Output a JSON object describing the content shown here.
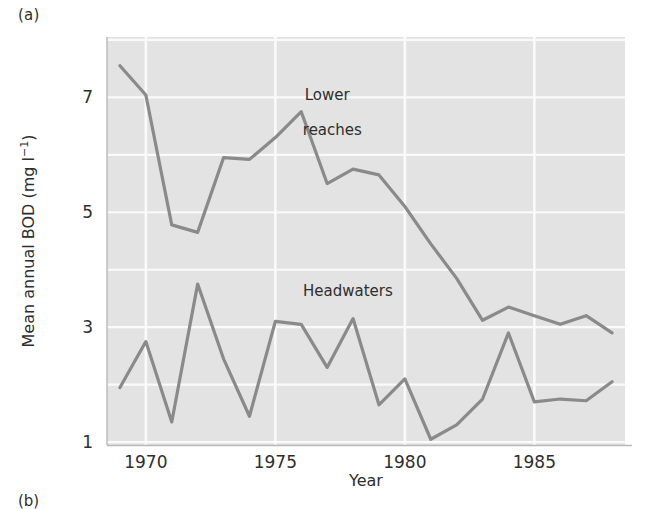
{
  "figure": {
    "panel_label": "(a)",
    "panel_label_next": "(b)",
    "plot_bg_color": "#e3e3e3",
    "grid_color": "#fafafa",
    "line_color": "#8a8a8a",
    "text_color": "#2e2e2e"
  },
  "chart_data": {
    "type": "line",
    "title": "",
    "xlabel": "Year",
    "ylabel": "Mean annual BOD (mg l⁻¹)",
    "ylabel_parts": {
      "prefix": "Mean annual BOD (mg l",
      "exponent": "−1",
      "suffix": ")"
    },
    "xlim": [
      1968.5,
      1988.5
    ],
    "ylim": [
      0.95,
      8.05
    ],
    "xticks": [
      1970,
      1975,
      1980,
      1985
    ],
    "xtick_labels": [
      "1970",
      "1975",
      "1980",
      "1985"
    ],
    "yticks": [
      1,
      3,
      5,
      7
    ],
    "ytick_labels": [
      "1",
      "3",
      "5",
      "7"
    ],
    "grid": true,
    "grid_x": [
      1970,
      1975,
      1980,
      1985
    ],
    "grid_y": [
      1,
      2,
      3,
      4,
      5,
      6,
      7,
      8
    ],
    "legend": "inline-annotation",
    "x": [
      1969,
      1970,
      1971,
      1972,
      1973,
      1974,
      1975,
      1976,
      1977,
      1978,
      1979,
      1980,
      1981,
      1982,
      1983,
      1984,
      1985,
      1986,
      1987,
      1988
    ],
    "series": [
      {
        "name": "Lower reaches",
        "label_x": 1977.0,
        "label_y": 6.85,
        "values": [
          7.55,
          7.04,
          4.78,
          4.65,
          5.95,
          5.92,
          6.3,
          6.75,
          5.5,
          5.75,
          5.65,
          5.1,
          4.45,
          3.85,
          3.12,
          3.35,
          3.2,
          3.05,
          3.2,
          2.9
        ]
      },
      {
        "name": "Headwaters",
        "label_x": 1977.6,
        "label_y": 3.55,
        "values": [
          1.95,
          2.75,
          1.35,
          3.75,
          2.45,
          1.45,
          3.1,
          3.05,
          2.3,
          3.15,
          1.65,
          2.1,
          1.05,
          1.3,
          1.75,
          2.9,
          1.7,
          1.75,
          1.72,
          2.05
        ]
      }
    ],
    "annotations": [
      {
        "text": "Lower",
        "x": 1977.0,
        "y": 6.95
      },
      {
        "text": "reaches",
        "x": 1977.2,
        "y": 6.35
      },
      {
        "text": "Headwaters",
        "x": 1977.8,
        "y": 3.55
      }
    ]
  }
}
